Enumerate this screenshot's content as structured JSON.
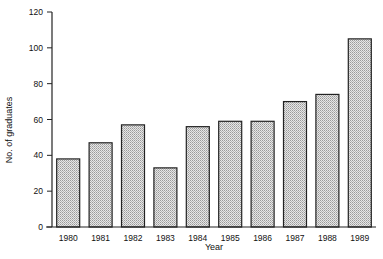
{
  "chart_data": {
    "type": "bar",
    "title": "",
    "xlabel": "Year",
    "ylabel": "No. of graduates",
    "categories": [
      "1980",
      "1981",
      "1982",
      "1983",
      "1984",
      "1985",
      "1986",
      "1987",
      "1988",
      "1989"
    ],
    "values": [
      38,
      47,
      57,
      33,
      56,
      59,
      59,
      70,
      74,
      105
    ],
    "ylim": [
      0,
      120
    ],
    "yticks": [
      0,
      20,
      40,
      60,
      80,
      100,
      120
    ],
    "grid": false,
    "legend": null,
    "bar_fill": "#d8d8d8",
    "bar_stroke": "#222222"
  }
}
